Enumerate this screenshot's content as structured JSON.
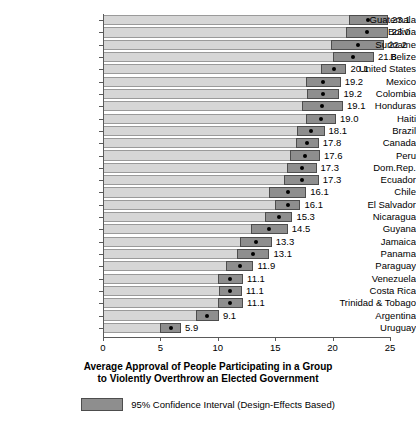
{
  "chart_data": {
    "type": "bar",
    "title": "",
    "xlabel": "Average Approval of People Participating in a Group to Violently Overthrow an Elected Government",
    "xlabel_line1": "Average Approval of People Participating in a Group",
    "xlabel_line2": "to Violently Overthrow an Elected Government",
    "ylabel": "",
    "xlim": [
      0,
      25
    ],
    "xticks": [
      "0",
      "5",
      "10",
      "15",
      "20",
      "25"
    ],
    "xtick_values": [
      0,
      5,
      10,
      15,
      20,
      25
    ],
    "grid": false,
    "orientation": "horizontal",
    "legend_position": "bottom",
    "legend": [
      {
        "label": "95% Confidence Interval (Design-Effects Based)",
        "color": "#8e8e8e"
      }
    ],
    "colors": {
      "bar": "#d6d6d6",
      "ci": "#8e8e8e",
      "point": "#000000",
      "axis": "#5a5a5a"
    },
    "categories": [
      "Guatemala",
      "Bolivia",
      "Suriname",
      "Belize",
      "United States",
      "Mexico",
      "Colombia",
      "Honduras",
      "Haiti",
      "Brazil",
      "Canada",
      "Peru",
      "Dom.Rep.",
      "Ecuador",
      "Chile",
      "El Salvador",
      "Nicaragua",
      "Guyana",
      "Jamaica",
      "Panama",
      "Paraguay",
      "Venezuela",
      "Costa Rica",
      "Trinidad & Tobago",
      "Argentina",
      "Uruguay"
    ],
    "values": [
      23.1,
      23.0,
      22.2,
      21.8,
      20.1,
      19.2,
      19.2,
      19.1,
      19.0,
      18.1,
      17.8,
      17.6,
      17.3,
      17.3,
      16.1,
      16.1,
      15.3,
      14.5,
      13.3,
      13.1,
      11.9,
      11.1,
      11.1,
      11.1,
      9.1,
      5.9
    ],
    "value_labels": [
      "23.1",
      "23.0",
      "22.2",
      "21.8",
      "20.1",
      "19.2",
      "19.2",
      "19.1",
      "19.0",
      "18.1",
      "17.8",
      "17.6",
      "17.3",
      "17.3",
      "16.1",
      "16.1",
      "15.3",
      "14.5",
      "13.3",
      "13.1",
      "11.9",
      "11.1",
      "11.1",
      "11.1",
      "9.1",
      "5.9"
    ],
    "ci_low": [
      21.4,
      21.2,
      19.9,
      20.0,
      19.0,
      17.7,
      17.8,
      17.3,
      17.7,
      16.9,
      16.8,
      16.3,
      16.0,
      15.8,
      14.5,
      15.0,
      14.1,
      12.9,
      11.9,
      11.7,
      10.7,
      10.0,
      10.1,
      10.0,
      8.1,
      5.0
    ],
    "ci_high": [
      24.8,
      24.8,
      24.5,
      23.6,
      21.2,
      20.7,
      20.6,
      20.9,
      20.3,
      19.3,
      18.8,
      18.9,
      18.6,
      18.8,
      17.7,
      17.2,
      16.5,
      16.1,
      14.7,
      14.5,
      13.1,
      12.2,
      12.1,
      12.2,
      10.1,
      6.8
    ],
    "series": [
      {
        "name": "Average Approval",
        "values": [
          23.1,
          23.0,
          22.2,
          21.8,
          20.1,
          19.2,
          19.2,
          19.1,
          19.0,
          18.1,
          17.8,
          17.6,
          17.3,
          17.3,
          16.1,
          16.1,
          15.3,
          14.5,
          13.3,
          13.1,
          11.9,
          11.1,
          11.1,
          11.1,
          9.1,
          5.9
        ]
      }
    ]
  }
}
